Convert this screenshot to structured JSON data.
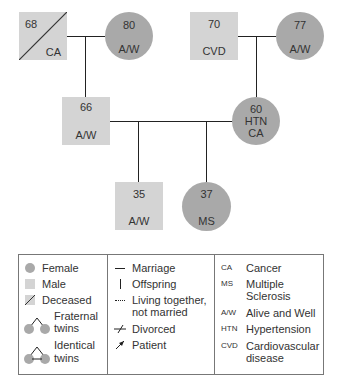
{
  "pedigree": {
    "grandparents_paternal": {
      "male": {
        "age": "68",
        "condition": "CA",
        "deceased": true
      },
      "female": {
        "age": "80",
        "condition": "A/W"
      }
    },
    "grandparents_maternal": {
      "male": {
        "age": "70",
        "condition": "CVD"
      },
      "female": {
        "age": "77",
        "condition": "A/W"
      }
    },
    "parents": {
      "father": {
        "age": "66",
        "condition": "A/W"
      },
      "mother": {
        "age": "60",
        "condition_1": "HTN",
        "condition_2": "CA"
      }
    },
    "children": {
      "son": {
        "age": "35",
        "condition": "A/W"
      },
      "daughter": {
        "age": "37",
        "condition": "MS"
      }
    }
  },
  "legend": {
    "symbols": {
      "female": "Female",
      "male": "Male",
      "deceased": "Deceased",
      "fraternal_1": "Fraternal",
      "fraternal_2": "twins",
      "identical_1": "Identical",
      "identical_2": "twins"
    },
    "lines": {
      "marriage": "Marriage",
      "offspring": "Offspring",
      "living_1": "Living together,",
      "living_2": "not married",
      "divorced": "Divorced",
      "patient": "Patient"
    },
    "abbreviations": [
      {
        "abbr": "CA",
        "meaning_1": "Cancer",
        "meaning_2": ""
      },
      {
        "abbr": "MS",
        "meaning_1": "Multiple",
        "meaning_2": "Sclerosis"
      },
      {
        "abbr": "A/W",
        "meaning_1": "Alive and Well",
        "meaning_2": ""
      },
      {
        "abbr": "HTN",
        "meaning_1": "Hypertension",
        "meaning_2": ""
      },
      {
        "abbr": "CVD",
        "meaning_1": "Cardiovascular",
        "meaning_2": "disease"
      }
    ]
  },
  "colors": {
    "male_fill": "#d4d4d4",
    "female_fill": "#a9a9a9",
    "line": "#222222",
    "border": "#777777"
  }
}
